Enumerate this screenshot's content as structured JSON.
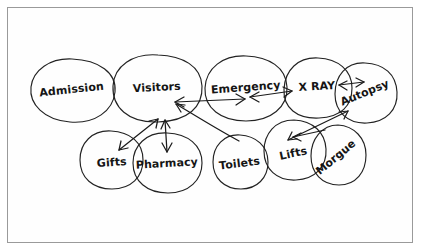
{
  "diagram": {
    "medium": "hand-drawn pencil sketch on white paper",
    "ink_color": "#1b1b1b",
    "paper_color": "#fefefe",
    "border_color": "#9a9a9a",
    "nodes": [
      {
        "id": "admission",
        "label": "Admission",
        "cx": 72,
        "cy": 90,
        "rx": 42,
        "ry": 31,
        "rot": -4,
        "label_rot": -6
      },
      {
        "id": "visitors",
        "label": "Visitors",
        "cx": 157,
        "cy": 88,
        "rx": 44,
        "ry": 33,
        "rot": 3,
        "label_rot": -3
      },
      {
        "id": "emergency",
        "label": "Emergency",
        "cx": 246,
        "cy": 88,
        "rx": 41,
        "ry": 32,
        "rot": -2,
        "label_rot": -4
      },
      {
        "id": "xray",
        "label": "X RAY",
        "cx": 318,
        "cy": 88,
        "rx": 34,
        "ry": 30,
        "rot": 5,
        "label_rot": -3
      },
      {
        "id": "autopsy",
        "label": "Autopsy",
        "cx": 366,
        "cy": 93,
        "rx": 32,
        "ry": 30,
        "rot": -6,
        "label_rot": -22
      },
      {
        "id": "gifts",
        "label": "Gifts",
        "cx": 112,
        "cy": 160,
        "rx": 32,
        "ry": 29,
        "rot": 4,
        "label_rot": -4
      },
      {
        "id": "pharmacy",
        "label": "Pharmacy",
        "cx": 167,
        "cy": 163,
        "rx": 35,
        "ry": 30,
        "rot": -3,
        "label_rot": -3
      },
      {
        "id": "toilets",
        "label": "Toilets",
        "cx": 240,
        "cy": 162,
        "rx": 28,
        "ry": 27,
        "rot": 6,
        "label_rot": -7
      },
      {
        "id": "lifts",
        "label": "Lifts",
        "cx": 295,
        "cy": 150,
        "rx": 32,
        "ry": 30,
        "rot": -5,
        "label_rot": -12
      },
      {
        "id": "morgue",
        "label": "Morgue",
        "cx": 338,
        "cy": 155,
        "rx": 28,
        "ry": 30,
        "rot": 8,
        "label_rot": -40
      }
    ],
    "links": [
      {
        "id": "visitors-emergency",
        "from": "visitors",
        "to": "emergency",
        "type": "double"
      },
      {
        "id": "emergency-xray",
        "from": "emergency",
        "to": "xray",
        "type": "double"
      },
      {
        "id": "xray-autopsy",
        "from": "xray",
        "to": "autopsy",
        "type": "double"
      },
      {
        "id": "gifts-visitors",
        "from": "gifts",
        "to": "visitors",
        "type": "double"
      },
      {
        "id": "visitors-pharmacy",
        "from": "visitors",
        "to": "pharmacy",
        "type": "double"
      },
      {
        "id": "toilets-visitors",
        "from": "toilets",
        "to": "visitors",
        "type": "single"
      },
      {
        "id": "lifts-autopsy",
        "from": "lifts",
        "to": "autopsy",
        "type": "double"
      },
      {
        "id": "morgue-lifts",
        "from": "morgue",
        "to": "lifts",
        "type": "single"
      }
    ]
  }
}
